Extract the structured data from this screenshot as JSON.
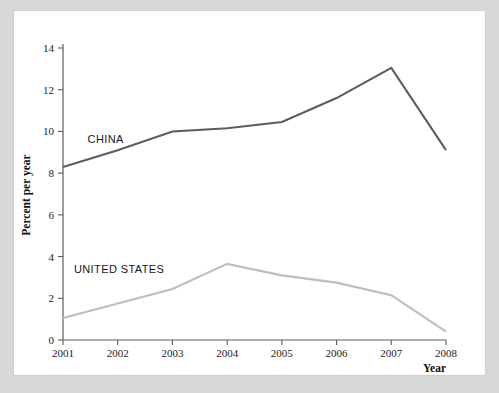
{
  "figure": {
    "background_color": "#d7d7d6",
    "plate_color": "#ffffff",
    "plate_border_color": "#cfcfce"
  },
  "axis": {
    "y_title": "Percent per year",
    "x_title": "Year",
    "y_ticks": [
      "0",
      "2",
      "4",
      "6",
      "8",
      "10",
      "12",
      "14"
    ],
    "x_ticks": [
      "2001",
      "2002",
      "2003",
      "2004",
      "2005",
      "2006",
      "2007",
      "2008"
    ],
    "axis_color": "#5b5b5b"
  },
  "series_labels": {
    "china": "CHINA",
    "united_states": "UNITED STATES"
  },
  "chart_data": {
    "type": "line",
    "title": "",
    "xlabel": "Year",
    "ylabel": "Percent per year",
    "x": [
      2001,
      2002,
      2003,
      2004,
      2005,
      2006,
      2007,
      2008
    ],
    "categories": [
      "2001",
      "2002",
      "2003",
      "2004",
      "2005",
      "2006",
      "2007",
      "2008"
    ],
    "xlim": [
      2001,
      2008
    ],
    "ylim": [
      0,
      14
    ],
    "y_ticks": [
      0,
      2,
      4,
      6,
      8,
      10,
      12,
      14
    ],
    "x_ticks": [
      2001,
      2002,
      2003,
      2004,
      2005,
      2006,
      2007,
      2008
    ],
    "grid": false,
    "legend": "inline-labels",
    "series": [
      {
        "name": "CHINA",
        "color": "#5d5d5d",
        "stroke_width": 2.1,
        "values": [
          8.3,
          9.1,
          10.0,
          10.15,
          10.45,
          11.6,
          13.05,
          9.1
        ]
      },
      {
        "name": "UNITED STATES",
        "color": "#bdbdbd",
        "stroke_width": 2.1,
        "values": [
          1.05,
          1.75,
          2.45,
          3.65,
          3.1,
          2.75,
          2.15,
          0.4
        ]
      }
    ],
    "annotations": [
      {
        "text": "CHINA",
        "x": 2001.45,
        "y": 9.45
      },
      {
        "text": "UNITED STATES",
        "x": 2001.2,
        "y": 3.2
      }
    ]
  }
}
